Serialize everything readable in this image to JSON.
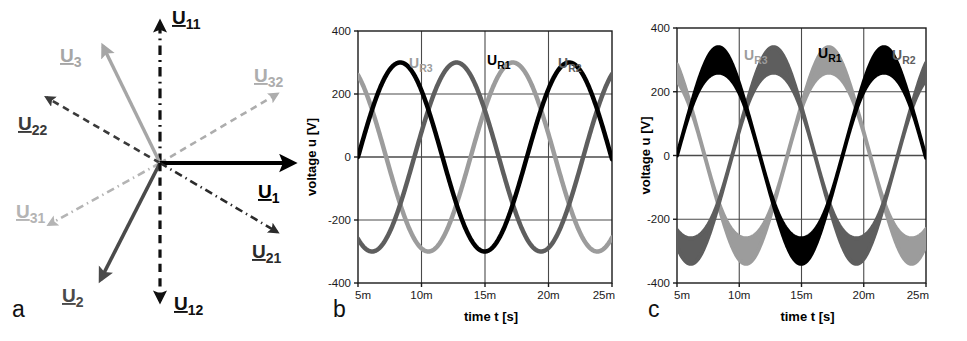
{
  "figure": {
    "panels": [
      {
        "letter": "a",
        "kind": "phasor-diagram"
      },
      {
        "letter": "b",
        "kind": "chart"
      },
      {
        "letter": "c",
        "kind": "chart"
      }
    ]
  },
  "phasor": {
    "title": "",
    "origin": {
      "x": 160,
      "y": 163
    },
    "vectors": [
      {
        "name": "U11",
        "base": "U",
        "sub": "11",
        "angle_deg": 90,
        "length": 141,
        "style": "dash-dot",
        "color": "#101010",
        "width": 3.2,
        "label": {
          "x": 172,
          "y": 24,
          "anchor": "start"
        }
      },
      {
        "name": "U3",
        "base": "U",
        "sub": "3",
        "angle_deg": 116,
        "length": 130,
        "style": "solid",
        "color": "#a6a6a6",
        "width": 3.4,
        "label": {
          "x": 60,
          "y": 62,
          "anchor": "start"
        }
      },
      {
        "name": "U32",
        "base": "U",
        "sub": "32",
        "angle_deg": 30.5,
        "length": 136,
        "style": "dashed",
        "color": "#adadad",
        "width": 2.6,
        "label": {
          "x": 254,
          "y": 82,
          "anchor": "start"
        }
      },
      {
        "name": "U22",
        "base": "U",
        "sub": "22",
        "angle_deg": 150,
        "length": 131,
        "style": "dashed",
        "color": "#3a3a3a",
        "width": 2.6,
        "label": {
          "x": 18,
          "y": 130,
          "anchor": "start"
        }
      },
      {
        "name": "U1",
        "base": "U",
        "sub": "1",
        "angle_deg": 0,
        "length": 133,
        "style": "solid",
        "color": "#000000",
        "width": 4.2,
        "label": {
          "x": 258,
          "y": 198,
          "anchor": "start"
        }
      },
      {
        "name": "U31",
        "base": "U",
        "sub": "31",
        "angle_deg": 209,
        "length": 127,
        "style": "dash-dot",
        "color": "#b4b4b4",
        "width": 2.6,
        "label": {
          "x": 16,
          "y": 218,
          "anchor": "start"
        }
      },
      {
        "name": "U21",
        "base": "U",
        "sub": "21",
        "angle_deg": -30.5,
        "length": 136,
        "style": "dash-dot",
        "color": "#2b2b2b",
        "width": 2.6,
        "label": {
          "x": 252,
          "y": 258,
          "anchor": "start"
        }
      },
      {
        "name": "U2",
        "base": "U",
        "sub": "2",
        "angle_deg": -117,
        "length": 131,
        "style": "solid",
        "color": "#4a4a4a",
        "width": 3.6,
        "label": {
          "x": 62,
          "y": 302,
          "anchor": "start"
        }
      },
      {
        "name": "U12",
        "base": "U",
        "sub": "12",
        "angle_deg": -90,
        "length": 138,
        "style": "dashed",
        "color": "#101010",
        "width": 3.2,
        "label": {
          "x": 174,
          "y": 310,
          "anchor": "start"
        }
      }
    ]
  },
  "chart_data": [
    {
      "panel": "b",
      "type": "line",
      "title": "",
      "xlabel": "time  t   [s]",
      "ylabel": "voltage  u   [V]",
      "xlim": [
        5,
        25
      ],
      "ylim": [
        -400,
        400
      ],
      "xticks": [
        5,
        10,
        15,
        20,
        25
      ],
      "xticklabels": [
        "5m",
        "10m",
        "15m",
        "20m",
        "25m"
      ],
      "yticks": [
        -400,
        -200,
        0,
        200,
        400
      ],
      "yticklabels": [
        "-400",
        "-200",
        "0",
        "200",
        "400"
      ],
      "grid": true,
      "legend": "inline-annotations",
      "annotations": [
        {
          "text": "UR3",
          "base": "U",
          "sub": "R3",
          "x": 409,
          "y": 68,
          "color": "#9c9c9c"
        },
        {
          "text": "UR1",
          "base": "U",
          "sub": "R1",
          "x": 487,
          "y": 65,
          "color": "#000000"
        },
        {
          "text": "UR2",
          "base": "U",
          "sub": "R2",
          "x": 558,
          "y": 68,
          "color": "#5e5e5e"
        }
      ],
      "series": [
        {
          "name": "UR1",
          "color": "#000000",
          "amplitude": 300,
          "period_ms": 13.3,
          "phase_deg": 0,
          "offset": 0,
          "linewidth": 4.5,
          "band": 0
        },
        {
          "name": "UR2",
          "color": "#5e5e5e",
          "amplitude": 300,
          "period_ms": 13.3,
          "phase_deg": -120,
          "offset": 0,
          "linewidth": 4.5,
          "band": 0
        },
        {
          "name": "UR3",
          "color": "#9c9c9c",
          "amplitude": 300,
          "period_ms": 13.3,
          "phase_deg": 120,
          "offset": 0,
          "linewidth": 4.5,
          "band": 0
        }
      ]
    },
    {
      "panel": "c",
      "type": "line",
      "title": "",
      "xlabel": "time  t   [s]",
      "ylabel": "voltage  u   [V]",
      "xlim": [
        5,
        25
      ],
      "ylim": [
        -400,
        400
      ],
      "xticks": [
        5,
        10,
        15,
        20,
        25
      ],
      "xticklabels": [
        "5m",
        "10m",
        "15m",
        "20m",
        "25m"
      ],
      "yticks": [
        -400,
        -200,
        0,
        200,
        400
      ],
      "yticklabels": [
        "-400",
        "-200",
        "0",
        "200",
        "400"
      ],
      "grid": true,
      "legend": "inline-annotations",
      "annotations": [
        {
          "text": "UR3",
          "base": "U",
          "sub": "R3",
          "x": 744,
          "y": 60,
          "color": "#9c9c9c"
        },
        {
          "text": "UR1",
          "base": "U",
          "sub": "R1",
          "x": 818,
          "y": 58,
          "color": "#000000"
        },
        {
          "text": "UR2",
          "base": "U",
          "sub": "R2",
          "x": 892,
          "y": 60,
          "color": "#5e5e5e"
        }
      ],
      "series": [
        {
          "name": "UR1",
          "color": "#000000",
          "amplitude": 300,
          "period_ms": 13.3,
          "phase_deg": 0,
          "offset": 0,
          "linewidth": 4.0,
          "band": 40
        },
        {
          "name": "UR2",
          "color": "#5e5e5e",
          "amplitude": 300,
          "period_ms": 13.3,
          "phase_deg": -120,
          "offset": 0,
          "linewidth": 4.0,
          "band": 40
        },
        {
          "name": "UR3",
          "color": "#9c9c9c",
          "amplitude": 300,
          "period_ms": 13.3,
          "phase_deg": 120,
          "offset": 0,
          "linewidth": 4.0,
          "band": 40
        }
      ]
    }
  ],
  "colors": {
    "ur1": "#000000",
    "ur2": "#5e5e5e",
    "ur3": "#9c9c9c",
    "grid": "#4a4a4a",
    "axis": "#1a1a1a",
    "background": "#ffffff"
  }
}
